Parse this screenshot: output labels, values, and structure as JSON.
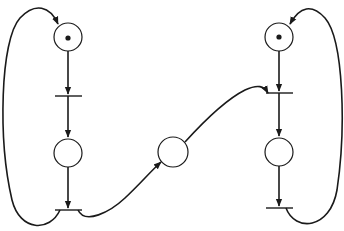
{
  "diagram": {
    "type": "petri-net",
    "colors": {
      "stroke": "#1a1a1a",
      "background": "#ffffff"
    },
    "places": [
      {
        "id": "p1",
        "cx": 68,
        "cy": 37,
        "r": 14,
        "tokens": 1
      },
      {
        "id": "p2",
        "cx": 68,
        "cy": 153,
        "r": 14,
        "tokens": 0
      },
      {
        "id": "p3",
        "cx": 173,
        "cy": 152,
        "r": 15,
        "tokens": 0
      },
      {
        "id": "p4",
        "cx": 279,
        "cy": 37,
        "r": 14,
        "tokens": 1
      },
      {
        "id": "p5",
        "cx": 279,
        "cy": 152,
        "r": 14,
        "tokens": 0
      }
    ],
    "transitions": [
      {
        "id": "t1",
        "x1": 55,
        "x2": 82,
        "y": 96
      },
      {
        "id": "t2",
        "x1": 55,
        "x2": 82,
        "y": 210
      },
      {
        "id": "t3",
        "x1": 266,
        "x2": 293,
        "y": 93
      },
      {
        "id": "t4",
        "x1": 266,
        "x2": 293,
        "y": 208
      }
    ]
  }
}
